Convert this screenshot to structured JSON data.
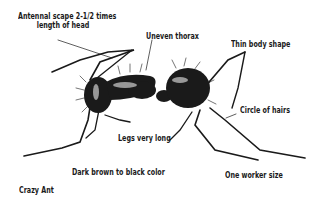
{
  "figure": {
    "caption": "Crazy Ant",
    "labels": [
      {
        "id": "antennal-scape",
        "line1": "Antennal scape 2-1/2 times",
        "line2": "length of head"
      },
      {
        "id": "uneven-thorax",
        "text": "Uneven thorax"
      },
      {
        "id": "thin-body-shape",
        "text": "Thin body shape"
      },
      {
        "id": "circle-of-hairs",
        "text": "Circle of hairs"
      },
      {
        "id": "legs-very-long",
        "text": "Legs very long"
      },
      {
        "id": "color",
        "text": "Dark brown to black color"
      },
      {
        "id": "worker-size",
        "text": "One worker size"
      }
    ],
    "colors": {
      "ink": "#1a1a1a",
      "background": "#ffffff"
    }
  }
}
